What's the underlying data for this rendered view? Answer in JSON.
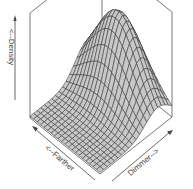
{
  "chart_data": {
    "type": "surface3d",
    "title": "",
    "xlabel": "<--Farther",
    "ylabel": "Dimmer-->",
    "zlabel": "<--Density",
    "box": true,
    "ticks": false,
    "grid_lines": 20,
    "surface_fill": "#c8c8c8",
    "mesh_color": "#333333",
    "box_color": "#555555",
    "surface": {
      "kind": "bivariate-gaussian",
      "peak_dimmer": 0.8,
      "peak_farther": 0.55,
      "sd_dimmer": 0.17,
      "sd_farther": 0.32,
      "peak_density": 1.0,
      "min_density": 0.02
    }
  },
  "labels": {
    "z_axis": "<--Density",
    "x_axis": "<--Farther",
    "y_axis": "Dimmer-->"
  }
}
